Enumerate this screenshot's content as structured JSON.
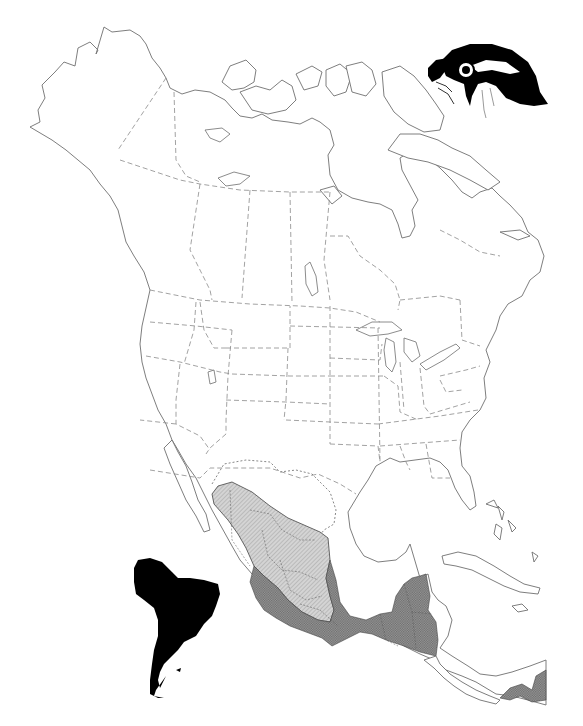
{
  "map": {
    "subject": "Range map of a falcon species in the Americas",
    "region": "North, Central and South America",
    "illustration": "falcon-head-drawing",
    "legend_regions": [
      {
        "name": "breeding-or-northern-range",
        "pattern": "light hatched gray",
        "color": "#c8c8c8"
      },
      {
        "name": "year-round-range",
        "pattern": "dark stippled gray",
        "color": "#8c8c8c"
      },
      {
        "name": "south-america-range",
        "pattern": "solid black",
        "color": "#000000"
      },
      {
        "name": "historic-range-boundary",
        "pattern": "dotted line",
        "color": "#7a7a7a"
      }
    ],
    "colors": {
      "background": "#ffffff",
      "coastline": "#6f6f6f",
      "political_border": "#8a8a8a",
      "light_range": "#c8c8c8",
      "dark_range": "#8c8c8c",
      "south_america": "#000000"
    }
  }
}
